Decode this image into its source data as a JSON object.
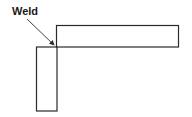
{
  "diagram": {
    "label": "Weld",
    "stroke_color": "#2a2a2a",
    "background": "#ffffff",
    "horizontal_member": {
      "x": 56,
      "y": 25,
      "width": 123,
      "height": 22
    },
    "vertical_member": {
      "x": 36,
      "y": 47,
      "width": 21,
      "height": 64
    },
    "arrow": {
      "from": [
        27,
        19
      ],
      "to": [
        55,
        46
      ]
    }
  }
}
